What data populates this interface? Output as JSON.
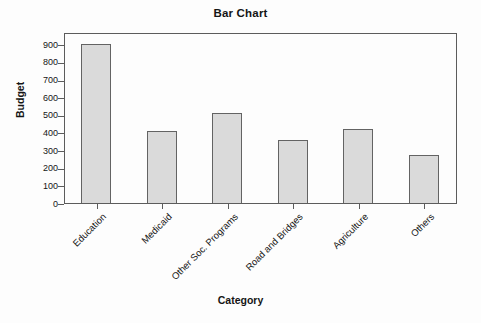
{
  "figure": {
    "background": "#fdfdfd"
  },
  "chart_data": {
    "type": "bar",
    "title": "Bar Chart",
    "xlabel": "Category",
    "ylabel": "Budget",
    "categories": [
      "Education",
      "Medicaid",
      "Other Soc. Programs",
      "Road and Bridges",
      "Agriculture",
      "Others"
    ],
    "values": [
      900,
      410,
      510,
      360,
      420,
      270
    ],
    "yticks": [
      0,
      100,
      200,
      300,
      400,
      500,
      600,
      700,
      800,
      900
    ],
    "ylim": [
      0,
      970
    ],
    "grid": false,
    "legend": "none",
    "colors": {
      "bar_fill": "#dadada",
      "bar_border": "#636363",
      "plot_border": "#5c5c5c",
      "text": "#151515"
    }
  }
}
